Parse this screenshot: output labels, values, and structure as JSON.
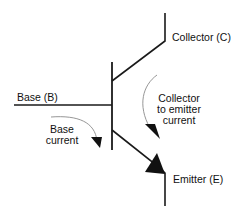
{
  "diagram": {
    "type": "npn-transistor-schematic",
    "labels": {
      "collector": "Collector (C)",
      "base": "Base (B)",
      "emitter": "Emitter (E)",
      "base_current_line1": "Base",
      "base_current_line2": "current",
      "ce_current_line1": "Collector",
      "ce_current_line2": "to emitter",
      "ce_current_line3": "current"
    },
    "colors": {
      "line": "#1a1a1a",
      "arrow_curve": "#8a8a8a",
      "text": "#111111"
    }
  }
}
